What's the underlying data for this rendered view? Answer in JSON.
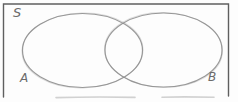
{
  "diagram": {
    "type": "venn",
    "universe_label": "S",
    "sets": [
      {
        "label": "A"
      },
      {
        "label": "B"
      }
    ],
    "colors": {
      "background": "#fdfdfd",
      "border": "#5f5f5f",
      "border_faint": "#c6c6c6",
      "ellipse_stroke": "#8e8e8e",
      "ellipse_ghost": "#b5b5b5",
      "label": "#6b6b6b"
    }
  }
}
